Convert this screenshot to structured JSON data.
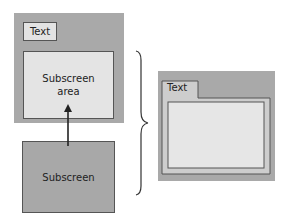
{
  "diagram": {
    "left_screen": {
      "label_text": "Text",
      "subscreen_area_line1": "Subscreen",
      "subscreen_area_line2": "area"
    },
    "subscreen_box": {
      "label": "Subscreen"
    },
    "right_screen": {
      "tab_label": "Text"
    },
    "colors": {
      "dark_grey": "#a9a9a9",
      "light_grey": "#e4e4e4",
      "outline": "#555555"
    }
  }
}
